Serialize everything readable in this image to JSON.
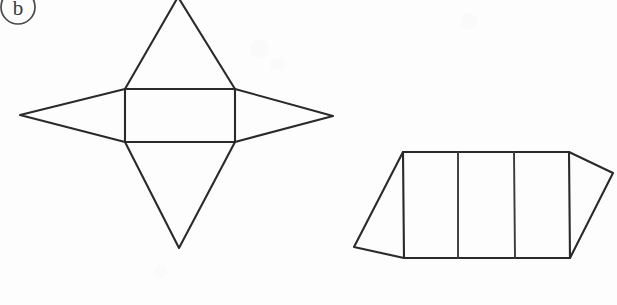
{
  "page": {
    "width": 617,
    "height": 305,
    "background_color": "#fdfdfd",
    "ink_color": "#2a2a2a"
  },
  "item_label": {
    "text": "b",
    "shape": "circled",
    "note": "circle is clipped by the top edge of the image"
  },
  "figures": [
    {
      "name": "star-net",
      "description": "Net made of a central rectangle with four isosceles triangles, one on each side, forming a four-pointed star.",
      "rectangle": {
        "left": 125,
        "top": 89,
        "right": 235,
        "bottom": 142
      },
      "apexes": {
        "top": {
          "x": 178,
          "y": -3
        },
        "bottom": {
          "x": 179,
          "y": 248
        },
        "left": {
          "x": 20,
          "y": 115
        },
        "right": {
          "x": 333,
          "y": 116
        }
      },
      "triangle_count": 4,
      "rectangle_count": 1
    },
    {
      "name": "prism-net",
      "description": "Net of a triangular prism: three rectangles in a row with a triangular flap at each end.",
      "band": {
        "left": 403,
        "top": 152,
        "right": 569,
        "bottom": 258
      },
      "dividers_x": [
        458,
        514
      ],
      "apexes": {
        "left": {
          "x": 354,
          "y": 247
        },
        "right": {
          "x": 613,
          "y": 173
        }
      },
      "triangle_count": 2,
      "rectangle_count": 3
    }
  ]
}
